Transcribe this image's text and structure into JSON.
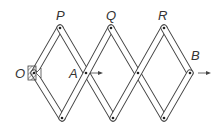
{
  "diagram": {
    "labels": {
      "O": "O",
      "P": "P",
      "Q": "Q",
      "R": "R",
      "A": "A",
      "B": "B"
    },
    "colors": {
      "stroke": "#444444",
      "label": "#333333",
      "background": "#ffffff"
    }
  }
}
